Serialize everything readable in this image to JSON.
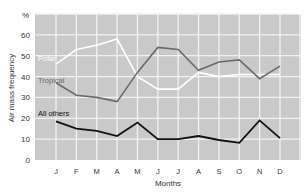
{
  "chart_data": {
    "type": "line",
    "title": "",
    "xlabel": "Months",
    "ylabel": "Air mass frequency",
    "yunit": "%",
    "ylim": [
      0,
      70
    ],
    "yticks": [
      0,
      10,
      20,
      30,
      40,
      50,
      60
    ],
    "grid": true,
    "categories": [
      "J",
      "F",
      "M",
      "A",
      "M",
      "J",
      "J",
      "A",
      "S",
      "O",
      "N",
      "D"
    ],
    "series": [
      {
        "name": "Polar",
        "color": "#ffffff",
        "label_pos": [
          38,
          61
        ],
        "values": [
          46,
          53,
          55,
          58,
          40,
          34,
          34,
          42,
          40,
          41,
          41,
          41
        ]
      },
      {
        "name": "Tropical",
        "color": "#6b6b6b",
        "label_pos": [
          38,
          83
        ],
        "values": [
          37,
          31,
          30,
          28,
          42,
          54,
          53,
          43,
          47,
          48,
          39,
          45
        ]
      },
      {
        "name": "All others",
        "color": "#111111",
        "label_pos": [
          38,
          116
        ],
        "values": [
          18.5,
          15,
          14,
          11.5,
          18,
          10,
          10,
          11.5,
          9.6,
          8.2,
          19,
          10.5
        ]
      }
    ]
  },
  "colors": {
    "plot_background": "#c9c9c9",
    "gridline": "#f2f2f2",
    "text": "#333333"
  }
}
